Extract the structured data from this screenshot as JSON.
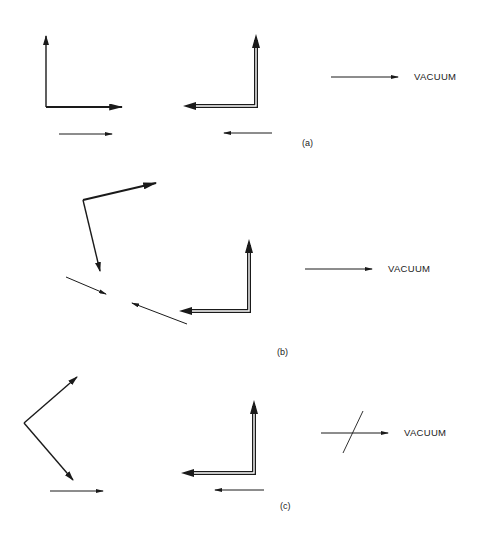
{
  "panels": [
    {
      "id": "a",
      "label": "(a)",
      "medium_label": "VACUUM",
      "medium_arrow": "plain"
    },
    {
      "id": "b",
      "label": "(b)",
      "medium_label": "VACUUM",
      "medium_arrow": "plain"
    },
    {
      "id": "c",
      "label": "(c)",
      "medium_label": "VACUUM",
      "medium_arrow": "crossed"
    }
  ],
  "colors": {
    "ink": "#1a1a1a",
    "background": "#ffffff"
  }
}
